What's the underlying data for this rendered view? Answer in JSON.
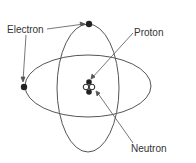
{
  "diagram": {
    "labels": {
      "electron": "Electron",
      "proton": "Proton",
      "neutron": "Neutron"
    },
    "colors": {
      "line": "#555555",
      "particle": "#222222",
      "background": "#ffffff"
    }
  }
}
